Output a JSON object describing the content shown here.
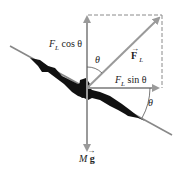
{
  "labels": {
    "fl_cos": "F_L cos θ",
    "fl_cos_f": "F",
    "fl_cos_sub": "L",
    "fl_cos_rest": " cos θ",
    "fl_vec": "F",
    "fl_vec_sub": "L",
    "fl_sin_f": "F",
    "fl_sin_sub": "L",
    "fl_sin_rest": " sin θ",
    "theta_top": "θ",
    "theta_wing": "θ",
    "mg_m": "M",
    "mg_g": "g"
  },
  "colors": {
    "arrow": "#9a9a9a",
    "wing": "#111111",
    "dash": "#8a8a8a",
    "text": "#222222"
  }
}
